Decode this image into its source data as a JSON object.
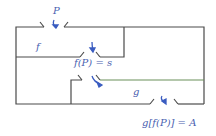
{
  "diagram": {
    "labels": {
      "p": "P",
      "f": "f",
      "fp_eq_s": "f(P) = s",
      "g": "g",
      "gfp_eq_a": "g[f(P)] = A"
    },
    "colors": {
      "wall": "#4a4a4a",
      "divider_green": "#6a8f5a",
      "label": "#4a5fb0",
      "arrow": "#3a5cc0"
    }
  }
}
